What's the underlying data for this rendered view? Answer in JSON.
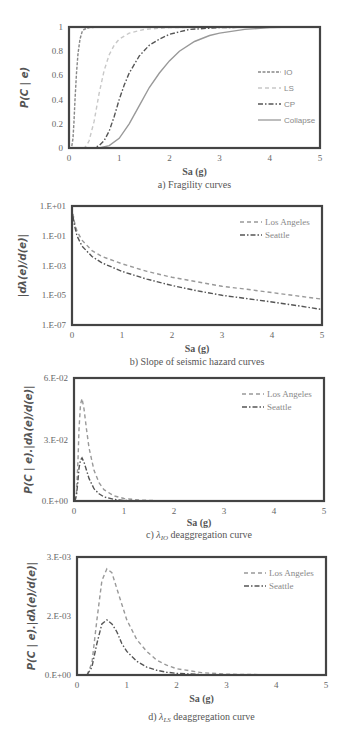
{
  "chart_data": [
    {
      "id": "a",
      "type": "line",
      "caption": "a) Fragility curves",
      "xlabel": "Sa (g)",
      "ylabel": "P(C | e)",
      "xlim": [
        0,
        5
      ],
      "ylim": [
        0,
        1
      ],
      "yscale": "linear",
      "xticks": [
        "0",
        "1",
        "2",
        "3",
        "4",
        "5"
      ],
      "yticks": [
        {
          "v": 0,
          "label": "0"
        },
        {
          "v": 0.2,
          "label": "0.2"
        },
        {
          "v": 0.4,
          "label": "0.4"
        },
        {
          "v": 0.6,
          "label": "0.6"
        },
        {
          "v": 0.8,
          "label": "0.8"
        },
        {
          "v": 1,
          "label": "1"
        }
      ],
      "legend_position": "right",
      "series": [
        {
          "name": "IO",
          "style": "dotted-dash",
          "color": "#888888",
          "x": [
            0,
            0.05,
            0.08,
            0.1,
            0.12,
            0.15,
            0.18,
            0.22,
            0.26,
            0.3,
            0.4,
            0.6,
            1,
            2,
            5
          ],
          "y": [
            0,
            0.0,
            0.08,
            0.22,
            0.4,
            0.62,
            0.78,
            0.9,
            0.96,
            0.98,
            0.995,
            1,
            1,
            1,
            1
          ]
        },
        {
          "name": "LS",
          "style": "dashed-light",
          "color": "#c8c8c8",
          "x": [
            0,
            0.3,
            0.35,
            0.4,
            0.5,
            0.6,
            0.7,
            0.8,
            0.9,
            1.0,
            1.2,
            1.5,
            2,
            3,
            5
          ],
          "y": [
            0,
            0.0,
            0.02,
            0.06,
            0.22,
            0.45,
            0.64,
            0.77,
            0.85,
            0.9,
            0.95,
            0.98,
            0.995,
            1,
            1
          ]
        },
        {
          "name": "CP",
          "style": "dash-dot",
          "color": "#555555",
          "x": [
            0,
            0.5,
            0.6,
            0.7,
            0.8,
            0.9,
            1.0,
            1.1,
            1.2,
            1.4,
            1.6,
            1.8,
            2.0,
            2.4,
            3,
            4,
            5
          ],
          "y": [
            0,
            0.0,
            0.02,
            0.06,
            0.14,
            0.26,
            0.4,
            0.52,
            0.62,
            0.76,
            0.85,
            0.9,
            0.94,
            0.98,
            0.995,
            1,
            1
          ]
        },
        {
          "name": "Collapse",
          "style": "solid",
          "color": "#999999",
          "x": [
            0,
            0.6,
            0.8,
            1.0,
            1.2,
            1.4,
            1.6,
            1.8,
            2.0,
            2.2,
            2.5,
            2.8,
            3.0,
            3.5,
            4.0,
            4.5,
            5
          ],
          "y": [
            0,
            0.0,
            0.02,
            0.08,
            0.2,
            0.35,
            0.5,
            0.62,
            0.72,
            0.8,
            0.88,
            0.93,
            0.95,
            0.98,
            0.995,
            1,
            1
          ]
        }
      ]
    },
    {
      "id": "b",
      "type": "line",
      "caption": "b) Slope of seismic hazard curves",
      "xlabel": "Sa (g)",
      "ylabel": "|dλ(e)/d(e)|",
      "xlim": [
        0,
        5
      ],
      "ylim": [
        1e-07,
        10
      ],
      "yscale": "log",
      "xticks": [
        "0",
        "1",
        "2",
        "3",
        "4",
        "5"
      ],
      "yticks": [
        {
          "v": 10,
          "label": "1.E+01"
        },
        {
          "v": 0.1,
          "label": "1.E-01"
        },
        {
          "v": 0.001,
          "label": "1.E-03"
        },
        {
          "v": 1e-05,
          "label": "1.E-05"
        },
        {
          "v": 1e-07,
          "label": "1.E-07"
        }
      ],
      "legend_position": "top-right",
      "series": [
        {
          "name": "Los Angeles",
          "style": "dashed",
          "color": "#999999",
          "x": [
            0.02,
            0.05,
            0.1,
            0.2,
            0.4,
            0.6,
            1.0,
            1.5,
            2.0,
            2.5,
            3.0,
            3.5,
            4.0,
            4.5,
            5.0
          ],
          "y": [
            3,
            0.8,
            0.2,
            0.05,
            0.01,
            0.004,
            0.0013,
            0.0004,
            0.00016,
            8e-05,
            4e-05,
            2.5e-05,
            1.5e-05,
            9e-06,
            5.5e-06
          ]
        },
        {
          "name": "Seattle",
          "style": "dash-dot",
          "color": "#555555",
          "x": [
            0.02,
            0.05,
            0.1,
            0.2,
            0.4,
            0.6,
            1.0,
            1.5,
            2.0,
            2.5,
            3.0,
            3.5,
            4.0,
            4.5,
            5.0
          ],
          "y": [
            2,
            0.5,
            0.1,
            0.02,
            0.004,
            0.0015,
            0.0004,
            0.00012,
            4.5e-05,
            2e-05,
            1e-05,
            6e-06,
            3.5e-06,
            2e-06,
            1.1e-06
          ]
        }
      ]
    },
    {
      "id": "c",
      "type": "line",
      "caption_prefix": "c) ",
      "caption_symbol": "λ",
      "caption_sub": "IO",
      "caption_suffix": " deaggregation curve",
      "xlabel": "Sa (g)",
      "ylabel": "P(C | e).|dλ(e)/d(e)|",
      "xlim": [
        0,
        5
      ],
      "ylim": [
        0,
        0.06
      ],
      "yscale": "linear",
      "xticks": [
        "0",
        "1",
        "2",
        "3",
        "4",
        "5"
      ],
      "yticks": [
        {
          "v": 0,
          "label": "0.E+00"
        },
        {
          "v": 0.03,
          "label": "3.E-02"
        },
        {
          "v": 0.06,
          "label": "6.E-02"
        }
      ],
      "legend_position": "top-right",
      "series": [
        {
          "name": "Los Angeles",
          "style": "dashed",
          "color": "#999999",
          "x": [
            0.02,
            0.05,
            0.08,
            0.1,
            0.13,
            0.16,
            0.2,
            0.25,
            0.3,
            0.4,
            0.5,
            0.6,
            0.8,
            1.0,
            1.3,
            1.6,
            2,
            3,
            4,
            5
          ],
          "y": [
            0,
            0.004,
            0.02,
            0.035,
            0.047,
            0.05,
            0.045,
            0.035,
            0.026,
            0.015,
            0.009,
            0.0055,
            0.0025,
            0.0012,
            0.0005,
            0.0002,
            0.0001,
            0,
            0,
            0
          ]
        },
        {
          "name": "Seattle",
          "style": "dash-dot",
          "color": "#555555",
          "x": [
            0.02,
            0.05,
            0.08,
            0.1,
            0.13,
            0.16,
            0.2,
            0.25,
            0.3,
            0.4,
            0.5,
            0.6,
            0.8,
            1.0,
            1.3,
            2,
            3,
            4,
            5
          ],
          "y": [
            0,
            0.003,
            0.01,
            0.016,
            0.02,
            0.021,
            0.019,
            0.015,
            0.011,
            0.006,
            0.0035,
            0.002,
            0.0008,
            0.0003,
            0.0001,
            0,
            0,
            0,
            0
          ]
        }
      ]
    },
    {
      "id": "d",
      "type": "line",
      "caption_prefix": "d) ",
      "caption_symbol": "λ",
      "caption_sub": "LS",
      "caption_suffix": " deaggregation curve",
      "xlabel": "Sa (g)",
      "ylabel": "P(C | e).|dλ(e)/d(e)|",
      "xlim": [
        0,
        5
      ],
      "ylim": [
        0,
        0.003
      ],
      "yscale": "linear",
      "xticks": [
        "0",
        "1",
        "2",
        "3",
        "4",
        "5"
      ],
      "yticks": [
        {
          "v": 0,
          "label": "0.E+00"
        },
        {
          "v": 0.0015,
          "label": "2.E-03"
        },
        {
          "v": 0.003,
          "label": "3.E-03"
        }
      ],
      "legend_position": "top-right",
      "series": [
        {
          "name": "Los Angeles",
          "style": "dashed",
          "color": "#999999",
          "x": [
            0.2,
            0.3,
            0.4,
            0.5,
            0.6,
            0.7,
            0.8,
            0.9,
            1.0,
            1.2,
            1.4,
            1.6,
            1.8,
            2.0,
            2.5,
            3.0,
            4.0,
            5.0
          ],
          "y": [
            0,
            0.0003,
            0.0014,
            0.0024,
            0.0027,
            0.0026,
            0.0022,
            0.0018,
            0.0014,
            0.0009,
            0.0006,
            0.00038,
            0.00025,
            0.00016,
            6e-05,
            2e-05,
            5e-06,
            0
          ]
        },
        {
          "name": "Seattle",
          "style": "dash-dot",
          "color": "#555555",
          "x": [
            0.2,
            0.3,
            0.4,
            0.5,
            0.6,
            0.7,
            0.8,
            0.9,
            1.0,
            1.2,
            1.4,
            1.6,
            1.8,
            2.0,
            2.5,
            3.0,
            4.0,
            5.0
          ],
          "y": [
            0,
            0.0002,
            0.0008,
            0.0013,
            0.0014,
            0.0013,
            0.0011,
            0.0008,
            0.0006,
            0.00035,
            0.0002,
            0.00012,
            7e-05,
            4e-05,
            1e-05,
            0,
            0,
            0
          ]
        }
      ]
    }
  ]
}
